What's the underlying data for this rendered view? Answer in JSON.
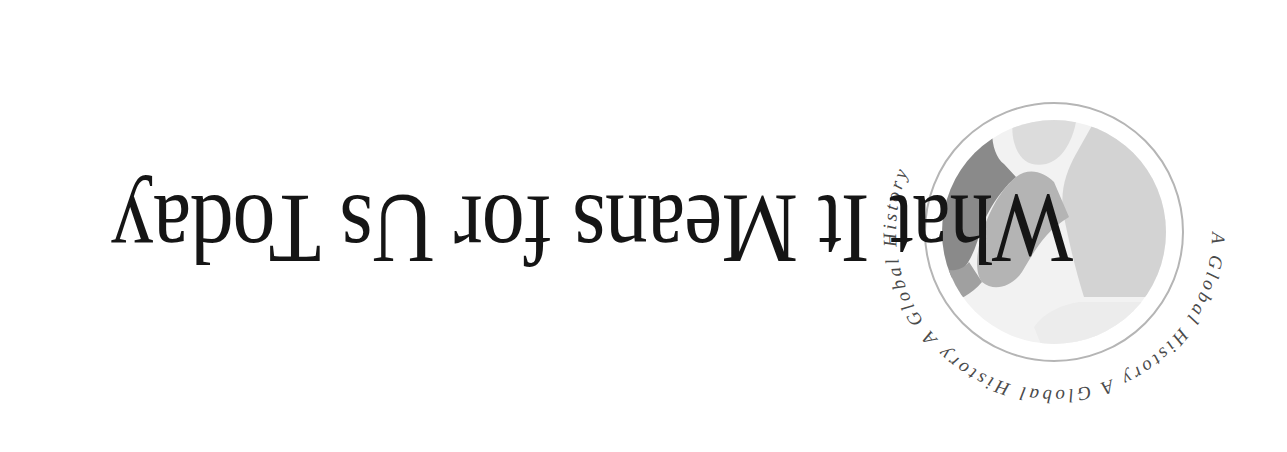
{
  "orientation": "rotated-180",
  "title": "What It Means for Us Today",
  "emblem": {
    "ring_text": "A Global History",
    "ring_text_repeated": "A Global History    A Global History    A Global History    ",
    "colors": {
      "ring": "#b5b5b5",
      "globe_light": "#d6d6d6",
      "globe_mid": "#a9a9a9",
      "globe_dark": "#7d7d7d",
      "globe_white": "#f4f4f4",
      "ring_text": "#4a4a4a"
    }
  },
  "colors": {
    "background": "#ffffff",
    "title_text": "#151515"
  }
}
